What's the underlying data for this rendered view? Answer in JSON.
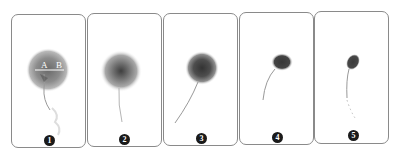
{
  "figure": {
    "panels": [
      {
        "number": "1",
        "annotations": {
          "left": "A",
          "right": "B"
        },
        "shape": "large diffuse halo with measurement line"
      },
      {
        "number": "2",
        "shape": "diffuse halo with darker core"
      },
      {
        "number": "3",
        "shape": "smaller halo with long curved tail"
      },
      {
        "number": "4",
        "shape": "compact dark head with curved tail"
      },
      {
        "number": "5",
        "shape": "oval dark head with dotted tail"
      }
    ],
    "colors": {
      "border": "#8a8a8a",
      "halo": "#8c8c8c",
      "core": "#3a3a3a",
      "badge": "#1a1a1a"
    }
  }
}
